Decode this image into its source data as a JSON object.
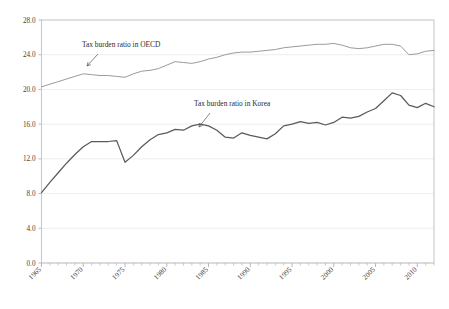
{
  "chart_data": {
    "type": "line",
    "title": "",
    "subtitle": "",
    "xlabel": "",
    "ylabel": "",
    "xlim": [
      1965,
      2012
    ],
    "ylim": [
      0.0,
      28.0
    ],
    "grid": true,
    "legend_position": "inline-annotation",
    "y_ticks": [
      "0.0",
      "4.0",
      "8.0",
      "12.0",
      "16.0",
      "20.0",
      "24.0",
      "28.0"
    ],
    "y_tick_values": [
      0.0,
      4.0,
      8.0,
      12.0,
      16.0,
      20.0,
      24.0,
      28.0
    ],
    "x_ticks": [
      "1965",
      "1970",
      "1975",
      "1980",
      "1985",
      "1990",
      "1995",
      "2000",
      "2005",
      "2010"
    ],
    "x_tick_values": [
      1965,
      1970,
      1975,
      1980,
      1985,
      1990,
      1995,
      2000,
      2005,
      2010
    ],
    "x": [
      1965,
      1966,
      1967,
      1968,
      1969,
      1970,
      1971,
      1972,
      1973,
      1974,
      1975,
      1976,
      1977,
      1978,
      1979,
      1980,
      1981,
      1982,
      1983,
      1984,
      1985,
      1986,
      1987,
      1988,
      1989,
      1990,
      1991,
      1992,
      1993,
      1994,
      1995,
      1996,
      1997,
      1998,
      1999,
      2000,
      2001,
      2002,
      2003,
      2004,
      2005,
      2006,
      2007,
      2008,
      2009,
      2010,
      2011,
      2012
    ],
    "series": [
      {
        "name": "Tax burden ratio in OECD",
        "color": "#9a9a9a",
        "values": [
          20.3,
          20.6,
          20.9,
          21.2,
          21.5,
          21.8,
          21.7,
          21.6,
          21.6,
          21.5,
          21.4,
          21.8,
          22.1,
          22.2,
          22.4,
          22.8,
          23.2,
          23.1,
          23.0,
          23.2,
          23.5,
          23.7,
          24.0,
          24.2,
          24.3,
          24.3,
          24.4,
          24.5,
          24.6,
          24.8,
          24.9,
          25.0,
          25.1,
          25.2,
          25.2,
          25.3,
          25.1,
          24.8,
          24.7,
          24.8,
          25.0,
          25.2,
          25.2,
          25.0,
          24.0,
          24.1,
          24.4,
          24.5
        ]
      },
      {
        "name": "Tax burden ratio in Korea",
        "color": "#5a5a5a",
        "values": [
          8.1,
          9.3,
          10.4,
          11.5,
          12.5,
          13.4,
          14.0,
          14.0,
          14.0,
          14.1,
          11.6,
          12.4,
          13.4,
          14.2,
          14.8,
          15.0,
          15.4,
          15.3,
          15.8,
          16.0,
          15.8,
          15.3,
          14.5,
          14.4,
          15.0,
          14.7,
          14.5,
          14.3,
          14.9,
          15.8,
          16.0,
          16.3,
          16.1,
          16.2,
          15.9,
          16.2,
          16.8,
          16.7,
          16.9,
          17.4,
          17.8,
          18.7,
          19.6,
          19.3,
          18.2,
          17.9,
          18.4,
          18.0
        ]
      }
    ],
    "annotations": [
      {
        "text": "Tax burden ratio in OECD",
        "target_x": 1973,
        "target_y": 21.6
      },
      {
        "text": "Tax burden ratio in Korea",
        "target_x": 1986,
        "target_y": 15.3
      }
    ]
  }
}
